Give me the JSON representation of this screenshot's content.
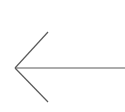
{
  "canvas": {
    "width": 125,
    "height": 112,
    "background_color": "#ffffff",
    "description": "left-pointing-arrow"
  },
  "figure": {
    "name": "left-arrow",
    "stroke_color": "#5a5a5a",
    "stroke_width": 1.2,
    "line_cap": "butt",
    "tip": {
      "x": 15,
      "y": 68
    },
    "shaft": {
      "x1": 15,
      "y1": 68,
      "x2": 125,
      "y2": 68
    },
    "barb_upper": {
      "x1": 15,
      "y1": 68,
      "x2": 48,
      "y2": 32
    },
    "barb_lower": {
      "x1": 15,
      "y1": 68,
      "x2": 48,
      "y2": 102
    }
  },
  "chart_data": {
    "type": "line",
    "title": "",
    "xlabel": "",
    "ylabel": "",
    "grid": false,
    "legend": null,
    "xlim": [
      0,
      125
    ],
    "ylim": [
      112,
      0
    ],
    "series": [
      {
        "name": "arrow-shaft",
        "x": [
          15,
          125
        ],
        "y": [
          68,
          68
        ]
      },
      {
        "name": "arrow-barb-upper",
        "x": [
          15,
          48
        ],
        "y": [
          68,
          32
        ]
      },
      {
        "name": "arrow-barb-lower",
        "x": [
          15,
          48
        ],
        "y": [
          68,
          102
        ]
      }
    ]
  }
}
